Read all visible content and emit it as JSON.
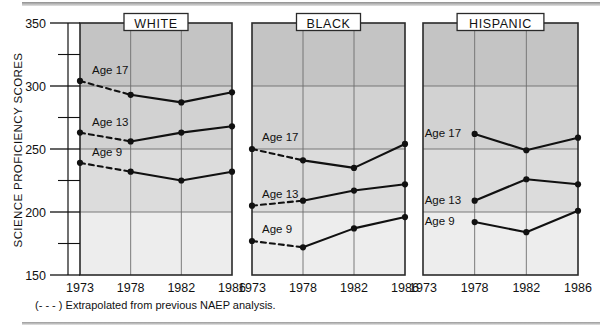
{
  "axis": {
    "y_title": "SCIENCE PROFICIENCY SCORES",
    "y_ticks_major": [
      350,
      300,
      250,
      200,
      150
    ],
    "y_ticks_minor": [
      325,
      275,
      225,
      175
    ],
    "ylim": [
      150,
      350
    ],
    "x_ticks": [
      1973,
      1978,
      1982,
      1986
    ]
  },
  "footnote": "(- - - ) Extrapolated from previous NAEP analysis.",
  "panel_titles": [
    "WHITE",
    "BLACK",
    "HISPANIC"
  ],
  "series_labels": {
    "age17": "Age 17",
    "age13": "Age 13",
    "age9": "Age 9"
  },
  "colors": {
    "band_1": "#c4c4c4",
    "band_2": "#d2d2d2",
    "band_3": "#dcdcdc",
    "band_4": "#ededed",
    "line": "#111111",
    "frame": "#2a2a2a",
    "grid": "#6e6e6e",
    "title_box_bg": "#ffffff"
  },
  "chart_data": {
    "type": "line",
    "xlabel": "",
    "ylabel": "SCIENCE PROFICIENCY SCORES",
    "ylim": [
      150,
      350
    ],
    "grid": true,
    "legend_position": "inline-labels",
    "x": [
      1973,
      1978,
      1982,
      1986
    ],
    "annotation": "(- - - ) Extrapolated from previous NAEP analysis.",
    "panels": [
      {
        "name": "WHITE",
        "series": [
          {
            "name": "Age 17",
            "x": [
              1973,
              1978,
              1982,
              1986
            ],
            "values": [
              304,
              293,
              287,
              295
            ],
            "extrapolated_segment": [
              1973,
              1978
            ]
          },
          {
            "name": "Age 13",
            "x": [
              1973,
              1978,
              1982,
              1986
            ],
            "values": [
              263,
              256,
              263,
              268
            ],
            "extrapolated_segment": [
              1973,
              1978
            ]
          },
          {
            "name": "Age 9",
            "x": [
              1973,
              1978,
              1982,
              1986
            ],
            "values": [
              239,
              232,
              225,
              232
            ],
            "extrapolated_segment": [
              1973,
              1978
            ]
          }
        ]
      },
      {
        "name": "BLACK",
        "series": [
          {
            "name": "Age 17",
            "x": [
              1973,
              1978,
              1982,
              1986
            ],
            "values": [
              250,
              241,
              235,
              254
            ],
            "extrapolated_segment": [
              1973,
              1978
            ]
          },
          {
            "name": "Age 13",
            "x": [
              1973,
              1978,
              1982,
              1986
            ],
            "values": [
              205,
              209,
              217,
              222
            ],
            "extrapolated_segment": [
              1973,
              1978
            ]
          },
          {
            "name": "Age 9",
            "x": [
              1973,
              1978,
              1982,
              1986
            ],
            "values": [
              177,
              172,
              187,
              196
            ],
            "extrapolated_segment": [
              1973,
              1978
            ]
          }
        ]
      },
      {
        "name": "HISPANIC",
        "series": [
          {
            "name": "Age 17",
            "x": [
              1978,
              1982,
              1986
            ],
            "values": [
              262,
              249,
              259
            ],
            "extrapolated_segment": null
          },
          {
            "name": "Age 13",
            "x": [
              1978,
              1982,
              1986
            ],
            "values": [
              209,
              226,
              222
            ],
            "extrapolated_segment": null
          },
          {
            "name": "Age 9",
            "x": [
              1978,
              1982,
              1986
            ],
            "values": [
              192,
              184,
              201
            ],
            "extrapolated_segment": null
          }
        ]
      }
    ]
  }
}
